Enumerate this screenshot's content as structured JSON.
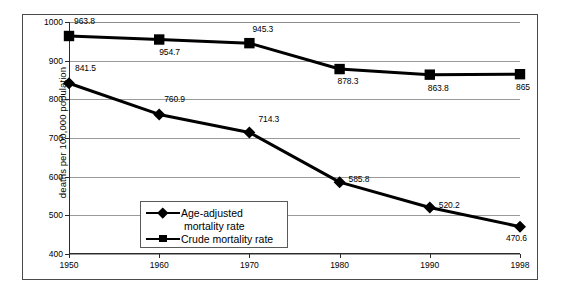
{
  "chart_data": {
    "type": "line",
    "title": "",
    "xlabel": "",
    "ylabel": "deaths per 100,000 population",
    "categories": [
      "1950",
      "1960",
      "1970",
      "1980",
      "1990",
      "1998"
    ],
    "ylim": [
      400,
      1000
    ],
    "yticks": [
      "400",
      "500",
      "600",
      "700",
      "800",
      "900",
      "1000"
    ],
    "grid": true,
    "legend_position": "inside-lower-left",
    "series": [
      {
        "name": "Age-adjusted mortality rate",
        "marker": "diamond",
        "color": "#000000",
        "values": [
          841.5,
          760.9,
          714.3,
          585.8,
          520.2,
          470.6
        ],
        "labels": [
          "841.5",
          "760.9",
          "714.3",
          "585.8",
          "520.2",
          "470.6"
        ]
      },
      {
        "name": "Crude mortality rate",
        "marker": "square",
        "color": "#000000",
        "values": [
          963.8,
          954.7,
          945.3,
          878.3,
          863.8,
          865
        ],
        "labels": [
          "963.8",
          "954.7",
          "945.3",
          "878.3",
          "863.8",
          "865"
        ]
      }
    ]
  },
  "legend": {
    "item1_line1": "Age-adjusted",
    "item1_line2": "mortality rate",
    "item2_line1": "Crude mortality rate"
  }
}
